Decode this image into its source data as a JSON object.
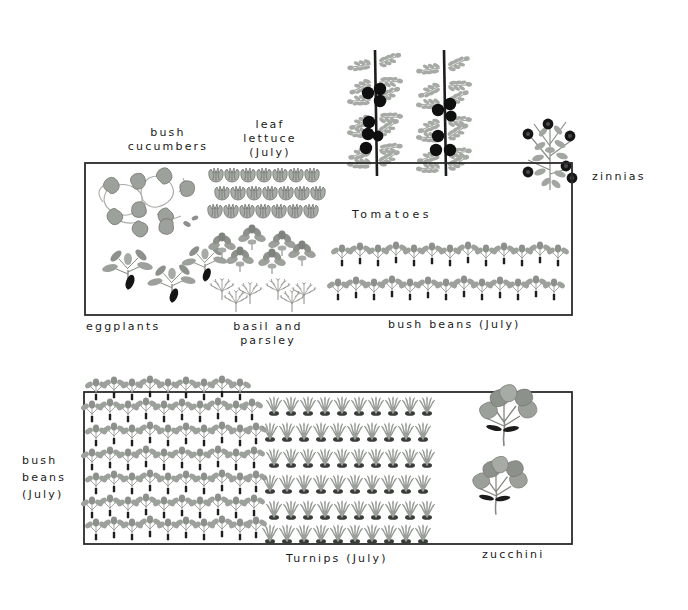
{
  "palette": {
    "ink": "#1a1a1a",
    "foliage_light": "#b9bcb7",
    "foliage_mid": "#8d918b",
    "foliage_dark": "#6a6e69",
    "fruit_dark": "#151515",
    "paper": "#ffffff"
  },
  "beds": [
    {
      "name": "upper-bed",
      "x": 85,
      "y": 163,
      "width": 487,
      "height": 152,
      "plots": [
        {
          "name": "bush-cucumbers",
          "label": "bush\ncucumbers",
          "label_position": "above-left"
        },
        {
          "name": "leaf-lettuce",
          "label": "leaf\nlettuce\n(July)",
          "label_position": "above"
        },
        {
          "name": "tomatoes",
          "label": "Tomatoes",
          "label_position": "inside"
        },
        {
          "name": "zinnias",
          "label": "zinnias",
          "label_position": "right"
        },
        {
          "name": "eggplants",
          "label": "eggplants",
          "label_position": "below-left"
        },
        {
          "name": "basil-and-parsley",
          "label": "basil and\nparsley",
          "label_position": "below"
        },
        {
          "name": "bush-beans-upper",
          "label": "bush beans (July)",
          "label_position": "below"
        }
      ]
    },
    {
      "name": "lower-bed",
      "x": 84,
      "y": 392,
      "width": 488,
      "height": 152,
      "plots": [
        {
          "name": "bush-beans-lower",
          "label": "bush\nbeans\n(July)",
          "label_position": "left"
        },
        {
          "name": "turnips",
          "label": "Turnips (July)",
          "label_position": "below"
        },
        {
          "name": "zucchini",
          "label": "zucchini",
          "label_position": "below"
        }
      ]
    }
  ],
  "labels": {
    "bush_cucumbers": "bush\ncucumbers",
    "leaf_lettuce": "leaf\nlettuce\n(July)",
    "tomatoes": "Tomatoes",
    "zinnias": "zinnias",
    "eggplants": "eggplants",
    "basil_and_parsley": "basil and\nparsley",
    "bush_beans_upper": "bush beans (July)",
    "bush_beans_lower": "bush\nbeans\n(July)",
    "turnips": "Turnips (July)",
    "zucchini": "zucchini"
  },
  "plantings": {
    "leaf_lettuce": {
      "rows": 3,
      "per_row": 7
    },
    "bush_beans_upper": {
      "rows": 2
    },
    "tomatoes": {
      "plants": 2,
      "staked": true
    },
    "zinnias": {
      "plants": 1
    },
    "eggplants": {
      "plants": 3
    },
    "basil": {
      "clusters": 6
    },
    "parsley": {
      "clusters": 6
    },
    "turnips": {
      "rows": 6,
      "per_row": 10
    },
    "zucchini": {
      "plants": 2
    }
  }
}
